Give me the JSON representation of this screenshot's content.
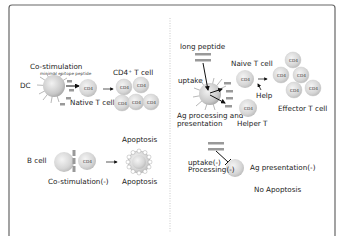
{
  "frame": {
    "border_color": "#555555",
    "divider_color": "#bbbbbb"
  },
  "left_panel": {
    "top": {
      "costim_label": "Co-stimulation",
      "epitope_label": "minimal epitope peptide",
      "dc_label": "DC",
      "naive_label": "Native T cell",
      "result_label": "CD4⁺ T cell",
      "cell_marker": "CD4"
    },
    "bottom": {
      "bcell_label": "B cell",
      "costim_neg_label": "Co-stimulation(-)",
      "apoptosis_top": "Apoptosis",
      "apoptosis_bottom": "Apoptosis",
      "cell_marker": "CD4"
    }
  },
  "right_panel": {
    "top": {
      "long_peptide_label": "long peptide",
      "uptake_label": "uptake",
      "processing_label_1": "Ag processing and",
      "processing_label_2": "presentation",
      "naive_label": "Naive T cell",
      "help_label": "Help",
      "helper_label": "Helper T",
      "effector_label": "Effector T cell",
      "cell_marker": "CD4"
    },
    "bottom": {
      "uptake_neg_label": "uptake(-)",
      "processing_neg_label": "Processing(-)",
      "ag_pres_neg_label": "Ag presentation(-)",
      "no_apoptosis_label": "No Apoptosis"
    }
  }
}
